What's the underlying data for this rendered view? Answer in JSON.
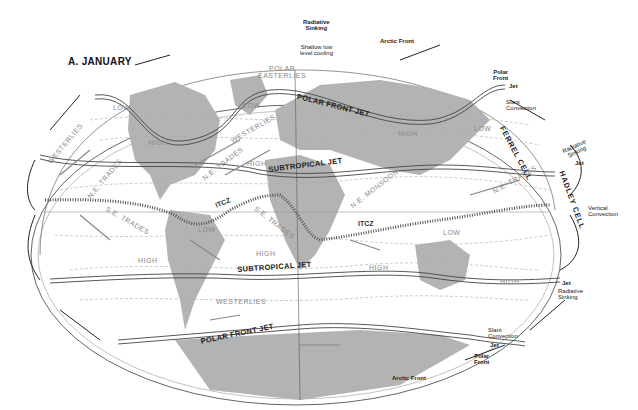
{
  "title": "A. JANUARY",
  "top_annotations": {
    "radiative_sinking": "Radiative\nSinking",
    "shallow_cooling": "Shallow low\nlevel cooling",
    "arctic_front_top": "Arctic Front",
    "polar_front_top": "Polar\nFront",
    "jet_top": "Jet",
    "slant_convection_top": "Slant\nConvection"
  },
  "right_annotations": {
    "ferrel_cell": "FERREL CELL",
    "radiative_sinking_north": "Radiative\nSinking",
    "jet_north": "Jet",
    "hadley_cell": "HADLEY CELL",
    "vertical_convection": "Vertical\nConvection",
    "jet_south": "Jet",
    "radiative_sinking_south": "Radiative\nSinking",
    "slant_convection_bottom": "Slant\nConvection",
    "jet_bottom": "Jet",
    "polar_front_bottom": "Polar\nFront",
    "arctic_front_bottom": "Arctic Front"
  },
  "jets": {
    "polar_front_north": "POLAR FRONT JET",
    "subtropical_north": "SUBTROPICAL JET",
    "subtropical_south": "SUBTROPICAL JET",
    "polar_front_south": "POLAR FRONT JET"
  },
  "itcz": [
    "ITCZ",
    "ITCZ"
  ],
  "winds": {
    "polar_easterlies": "POLAR\nEASTERLIES",
    "westerlies_nw": "WESTERLIES",
    "westerlies_n": "WESTERLIES",
    "ne_trades_1": "N.E. TRADES",
    "ne_trades_2": "N.E. TRADES",
    "ne_trades_3": "N.E. TRADES",
    "ne_monsoon": "N.E. MONSOON",
    "se_trades_1": "S.E. TRADES",
    "se_trades_2": "S.E. TRADES",
    "westerlies_s": "WESTERLIES"
  },
  "pressure": {
    "low_1": "LOW",
    "low_2": "LOW",
    "low_3": "LOW",
    "low_4": "LOW",
    "low_5": "LOW",
    "high_1": "HIGH",
    "high_2": "HIGH",
    "high_3": "HIGH",
    "high_4": "HIGH",
    "high_5": "HIGH",
    "high_6": "HIGH",
    "high_7": "HIGH"
  },
  "colors": {
    "land": "#b3b3b3",
    "ocean": "#ffffff",
    "lines": "#444444",
    "wind_text": "#888888"
  }
}
